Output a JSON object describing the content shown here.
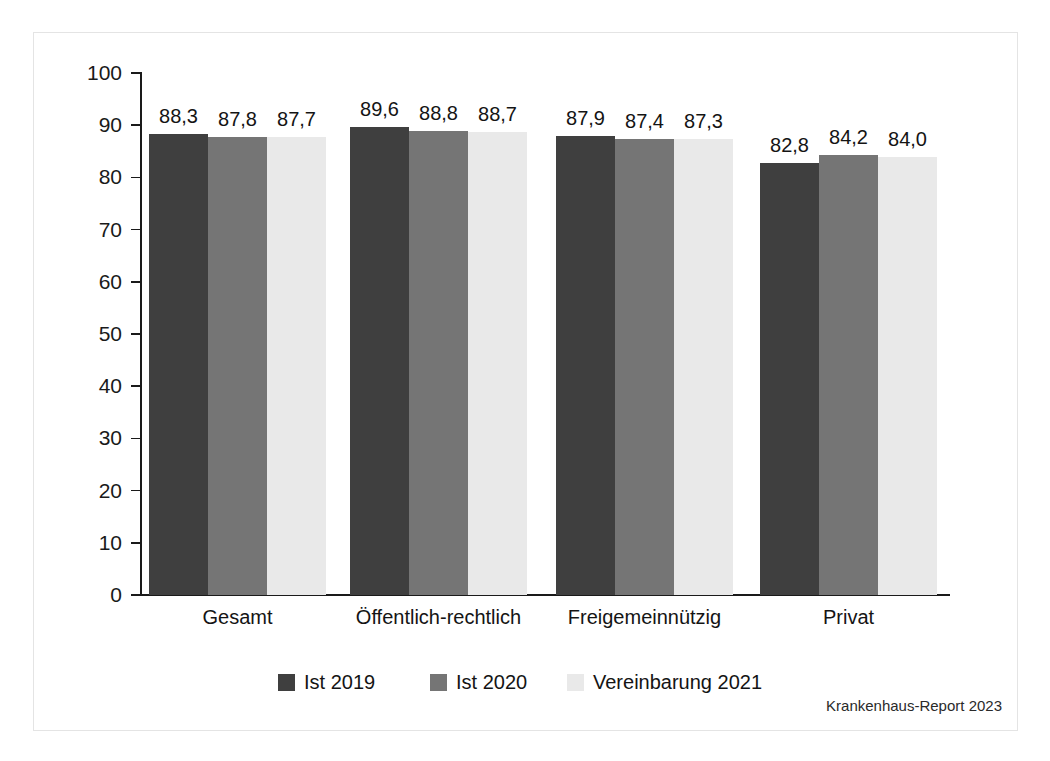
{
  "chart_data": {
    "type": "bar",
    "title": "",
    "subtitle": "",
    "xlabel": "",
    "ylabel": "",
    "ylim": [
      0,
      100
    ],
    "y_ticks": [
      0,
      10,
      20,
      30,
      40,
      50,
      60,
      70,
      80,
      90,
      100
    ],
    "grid": false,
    "legend_position": "bottom",
    "categories": [
      "Gesamt",
      "Öffentlich-rechtlich",
      "Freigemeinnützig",
      "Privat"
    ],
    "series": [
      {
        "name": "Ist 2019",
        "color": "#3f3f3f",
        "values": [
          88.3,
          89.6,
          87.9,
          82.8
        ],
        "labels": [
          "88,3",
          "89,6",
          "87,9",
          "82,8"
        ]
      },
      {
        "name": "Ist 2020",
        "color": "#757575",
        "values": [
          87.8,
          88.8,
          87.4,
          84.2
        ],
        "labels": [
          "87,8",
          "88,8",
          "87,4",
          "84,2"
        ]
      },
      {
        "name": "Vereinbarung 2021",
        "color": "#e9e9e9",
        "values": [
          87.7,
          88.7,
          87.3,
          84.0
        ],
        "labels": [
          "87,7",
          "88,7",
          "87,3",
          "84,0"
        ]
      }
    ],
    "source_note": "Krankenhaus-Report 2023"
  },
  "axis": {
    "tick_labels": [
      "100",
      "90",
      "80",
      "70",
      "60",
      "50",
      "40",
      "30",
      "20",
      "10",
      "0"
    ]
  },
  "legend": {
    "items": [
      {
        "label": "Ist 2019",
        "color": "#3f3f3f"
      },
      {
        "label": "Ist 2020",
        "color": "#757575"
      },
      {
        "label": "Vereinbarung 2021",
        "color": "#e9e9e9"
      }
    ]
  },
  "footer": {
    "source": "Krankenhaus-Report 2023"
  }
}
